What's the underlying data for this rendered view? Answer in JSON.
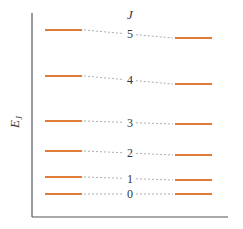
{
  "diagram": {
    "type": "energy-level-diagram",
    "y_axis_label": "E",
    "y_axis_label_sub": "J",
    "column_header": "J",
    "colors": {
      "level": "#e07b39",
      "connector": "#9a9a9a",
      "axis": "#555555",
      "text": "#333333"
    },
    "levels": [
      {
        "J": "5",
        "left_y": 30,
        "right_y": 38
      },
      {
        "J": "4",
        "left_y": 76,
        "right_y": 84
      },
      {
        "J": "3",
        "left_y": 121,
        "right_y": 124
      },
      {
        "J": "2",
        "left_y": 151,
        "right_y": 155
      },
      {
        "J": "1",
        "left_y": 177,
        "right_y": 180
      },
      {
        "J": "0",
        "left_y": 194,
        "right_y": 194
      }
    ],
    "left_column": {
      "x1": 45,
      "x2": 82
    },
    "right_column": {
      "x1": 175,
      "x2": 212
    },
    "label_x": 130
  }
}
